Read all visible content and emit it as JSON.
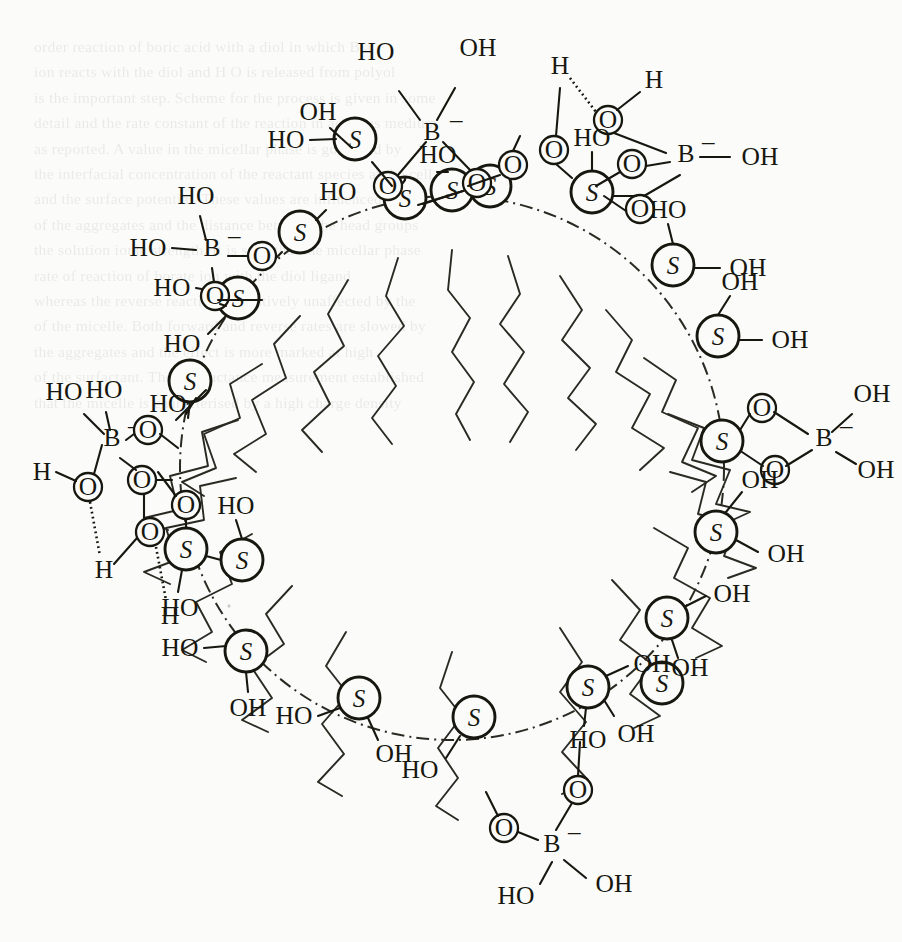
{
  "figure": {
    "kind": "chemical-structure-schematic",
    "background_text_opacity_note": "faint show-through text from reverse side of printed page (illegible)"
  },
  "colors": {
    "ink": "#17170f",
    "paper": "#fbfbfa",
    "showthrough": "#3a3a38"
  },
  "micelle": {
    "boundary_style": "dash-dot circle",
    "center": {
      "x": 452,
      "y": 468
    },
    "radius": 272,
    "headgroup_symbol": "S",
    "headgroup_count": 20,
    "tail_count": 20,
    "tail_style": "zigzag hydrocarbon chain"
  },
  "atoms": {
    "sulfur": "S",
    "boron": "B",
    "boron_charge": "–",
    "oxygen": "O",
    "hydrogen": "H",
    "hydroxyl": "OH",
    "hydroxyl_reversed": "HO"
  },
  "headgroups": [
    {
      "id": 1,
      "angle_deg": -100,
      "substituents": [
        "O",
        "OH"
      ],
      "note": "bonded to top borate via two O"
    },
    {
      "id": 2,
      "angle_deg": -82,
      "substituents": [
        "HO"
      ],
      "note": "free silanol, O bridge to right"
    },
    {
      "id": 3,
      "angle_deg": -64,
      "substituents": [
        "O",
        "O"
      ],
      "note": "cyclic diester to upper-right borate"
    },
    {
      "id": 4,
      "angle_deg": -46,
      "substituents": [
        "HO",
        "OH"
      ],
      "note": "free"
    },
    {
      "id": 5,
      "angle_deg": -26,
      "substituents": [
        "OH",
        "OH"
      ],
      "note": "free"
    },
    {
      "id": 6,
      "angle_deg": -6,
      "substituents": [
        "O",
        "O"
      ],
      "note": "cyclic diester to right borate"
    },
    {
      "id": 7,
      "angle_deg": 14,
      "substituents": [
        "OH",
        "OH"
      ],
      "note": "free"
    },
    {
      "id": 8,
      "angle_deg": 36,
      "substituents": [
        "OH",
        "OH"
      ],
      "note": "free"
    },
    {
      "id": 9,
      "angle_deg": 58,
      "substituents": [
        "OH",
        "HO"
      ],
      "note": "free"
    },
    {
      "id": 10,
      "angle_deg": 78,
      "substituents": [
        "O",
        "OH"
      ],
      "note": "to bottom borate"
    },
    {
      "id": 11,
      "angle_deg": 98,
      "substituents": [
        "HO",
        "O"
      ],
      "note": "to bottom borate"
    },
    {
      "id": 12,
      "angle_deg": 116,
      "substituents": [
        "HO",
        "OH"
      ],
      "note": "free"
    },
    {
      "id": 13,
      "angle_deg": 134,
      "substituents": [
        "HO",
        "OH"
      ],
      "note": "free"
    },
    {
      "id": 14,
      "angle_deg": 152,
      "substituents": [
        "HO",
        "OH"
      ],
      "note": "free"
    },
    {
      "id": 15,
      "angle_deg": 170,
      "substituents": [
        "O",
        "HO"
      ],
      "note": "water H-bond network"
    },
    {
      "id": 16,
      "angle_deg": 190,
      "substituents": [
        "O",
        "O",
        "O"
      ],
      "note": "left borate diester plus water"
    },
    {
      "id": 17,
      "angle_deg": 208,
      "substituents": [
        "HO",
        "HO"
      ],
      "note": "free"
    },
    {
      "id": 18,
      "angle_deg": 226,
      "substituents": [
        "HO"
      ],
      "note": "O bridge to upper-left borate"
    },
    {
      "id": 19,
      "angle_deg": 246,
      "substituents": [
        "HO",
        "O"
      ],
      "note": "upper-left borate ester"
    },
    {
      "id": 20,
      "angle_deg": 264,
      "substituents": [
        "HO",
        "OH"
      ],
      "note": "free"
    }
  ],
  "borates": [
    {
      "id": "borate-top",
      "position": "top centre",
      "label": "B",
      "charge": "–",
      "free_hydroxyls": [
        "HO",
        "OH"
      ],
      "ester_oxygens": [
        "O",
        "O"
      ],
      "bound_headgroups": [
        1
      ],
      "type": "cyclic diester"
    },
    {
      "id": "borate-upper-right",
      "position": "upper right",
      "label": "B",
      "charge": "–",
      "free_hydroxyls": [
        "OH"
      ],
      "ester_oxygens": [
        "O",
        "O"
      ],
      "bound_headgroups": [
        3
      ],
      "type": "cyclic diester with H-bonded waters"
    },
    {
      "id": "borate-right",
      "position": "right",
      "label": "B",
      "charge": "–",
      "free_hydroxyls": [
        "OH",
        "OH"
      ],
      "ester_oxygens": [
        "O",
        "O"
      ],
      "bound_headgroups": [
        6
      ],
      "type": "cyclic diester"
    },
    {
      "id": "borate-bottom",
      "position": "bottom centre",
      "label": "B",
      "charge": "–",
      "free_hydroxyls": [
        "HO",
        "OH"
      ],
      "ester_oxygens": [
        "O",
        "O"
      ],
      "bound_headgroups": [
        10,
        11
      ],
      "type": "bridging diester"
    },
    {
      "id": "borate-left",
      "position": "left",
      "label": "B",
      "charge": "–",
      "free_hydroxyls": [
        "HO",
        "HO"
      ],
      "ester_oxygens": [
        "O",
        "O"
      ],
      "bound_headgroups": [
        16
      ],
      "type": "cyclic diester with two H-bonded waters"
    },
    {
      "id": "borate-upper-left",
      "position": "upper left",
      "label": "B",
      "charge": "–",
      "free_hydroxyls": [
        "HO",
        "HO"
      ],
      "ester_oxygens": [
        "O",
        "O"
      ],
      "bound_headgroups": [
        18,
        19
      ],
      "type": "bridging diester"
    }
  ],
  "water_molecules": [
    {
      "id": "w1",
      "near": "borate-upper-right",
      "atoms": [
        "H",
        "O",
        "H"
      ],
      "hbond": "H⋯O"
    },
    {
      "id": "w2",
      "near": "borate-upper-right",
      "atoms": [
        "H",
        "O"
      ],
      "hbond": "H⋯O"
    },
    {
      "id": "w3",
      "near": "borate-left",
      "atoms": [
        "H",
        "O",
        "H"
      ],
      "hbond": "O⋯H"
    },
    {
      "id": "w4",
      "near": "borate-left",
      "atoms": [
        "O",
        "H"
      ],
      "hbond": "O⋯H"
    }
  ],
  "bond_styles": {
    "covalent": "solid line",
    "hydrogen_bond": "dotted / hatched line",
    "micelle_surface": "dash-dot arc"
  },
  "background_lines": [
    "order      reaction  of  boric  acid  with  a   diol in   which   B  a",
    "ion  reacts  with  the   diol  and   H  O   is   released  from  polyol",
    "is  the  important  step.  Scheme  for  the   process   is  given  in  some",
    "detail  and  the  rate  constant  of  the  reaction  in  aqueous   medium",
    "as   reported.   A   value   in   the   micellar   phase   is   governed   by",
    "the   interfacial   concentration  of  the  reactant  species  at   the   cell",
    "and  the   surface   potential.  These  values   are   influenced   by  the",
    "of   the   aggregates   and   the   distance   between   the   head   groups",
    "the   solution   ionic   strength.  It   is   seen   that  the   micellar  phase",
    "rate   of   reaction   of   borate   ion   with   the   diol   ligand",
    "whereas   the   reverse   reaction   is   relatively   unaffected  by   the",
    "of   the   micelle.   Both   forward   and  reverse   rates   are  slowed   by",
    "the  aggregates   and   the   effect   is  more   marked   at   high",
    "of   the   surfactant.   The   conductance   measurement   established",
    "that   the   micelle   is   characterised   by   a   high   charge   density"
  ]
}
